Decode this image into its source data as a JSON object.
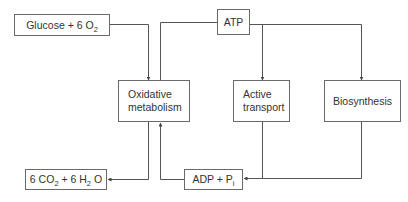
{
  "diagram": {
    "type": "flow",
    "colors": {
      "line": "#555555",
      "border": "#6a6a6a",
      "text": "#333333",
      "background": "#ffffff"
    },
    "nodes": {
      "glucose": {
        "text": "Glucose + 6 O",
        "sub": "2",
        "suffix": ""
      },
      "atp": {
        "text": "ATP"
      },
      "oxidative": {
        "line1": "Oxidative",
        "line2": "metabolism"
      },
      "active": {
        "line1": "Active",
        "line2": "transport"
      },
      "biosynthesis": {
        "text": "Biosynthesis"
      },
      "co2": {
        "p1": "6 CO",
        "s1": "2",
        "p2": " + 6 H",
        "s2": "2",
        "p3": " O"
      },
      "adp": {
        "text": "ADP + P",
        "sub": "i"
      }
    },
    "edges": [
      {
        "from": "Glucose + 6 O2",
        "to": "Oxidative metabolism"
      },
      {
        "from": "ATP",
        "to": "Oxidative metabolism",
        "note": "connector line"
      },
      {
        "from": "ATP",
        "to": "Active transport"
      },
      {
        "from": "ATP",
        "to": "Biosynthesis"
      },
      {
        "from": "Oxidative metabolism",
        "to": "6 CO2 + 6 H2O"
      },
      {
        "from": "ADP + Pi",
        "to": "Oxidative metabolism"
      },
      {
        "from": "Active transport",
        "to": "ADP + Pi"
      },
      {
        "from": "Biosynthesis",
        "to": "ADP + Pi"
      }
    ]
  }
}
